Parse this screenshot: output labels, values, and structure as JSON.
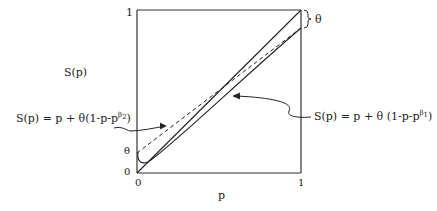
{
  "diagram": {
    "y_axis_label": "S(p)",
    "x_axis_label": "p",
    "y_ticks": {
      "top": "1",
      "theta": "θ",
      "bottom": "0"
    },
    "x_ticks": {
      "left": "0",
      "right": "1"
    },
    "brace_label": "θ",
    "theta_value": 0.11,
    "curves": [
      {
        "name": "diagonal",
        "style": "solid",
        "formula": "S(p) = p"
      },
      {
        "name": "beta2-curve",
        "style": "dashed",
        "formula_prefix": "S(p) = p + θ(1-p-p",
        "formula_sup": "β",
        "formula_sub": "2",
        "formula_suffix": ")"
      },
      {
        "name": "beta1-curve",
        "style": "solid",
        "formula_prefix": "S(p) = p + θ (1-p-p",
        "formula_sup": "β",
        "formula_sub": "1",
        "formula_suffix": ")"
      }
    ]
  }
}
